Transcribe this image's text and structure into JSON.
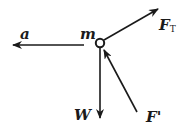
{
  "diagram": {
    "type": "free-body-diagram",
    "colors": {
      "stroke": "#1a1a1a",
      "background": "#ffffff"
    },
    "body": {
      "label": "m",
      "shape": "circle",
      "center": [
        100,
        43
      ],
      "radius": 4
    },
    "vectors": [
      {
        "id": "acceleration",
        "label": "a",
        "subscript": "",
        "from": [
          84,
          45
        ],
        "to": [
          13,
          45
        ]
      },
      {
        "id": "tension",
        "label": "F",
        "subscript": "T",
        "from": [
          104,
          40
        ],
        "to": [
          158,
          9
        ]
      },
      {
        "id": "weight",
        "label": "W",
        "subscript": "",
        "from": [
          100,
          47
        ],
        "to": [
          100,
          118
        ]
      },
      {
        "id": "normal-force",
        "label": "F'",
        "subscript": "",
        "from": [
          137,
          112
        ],
        "to": [
          104,
          50
        ]
      }
    ]
  }
}
